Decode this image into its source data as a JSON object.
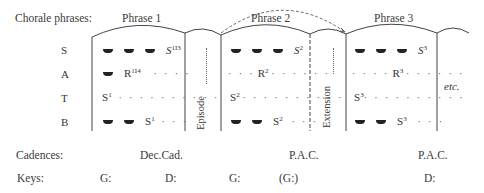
{
  "row_labels": {
    "phrases": "Chorale phrases:",
    "cadences": "Cadences:",
    "keys": "Keys:"
  },
  "phrases": [
    {
      "label": "Phrase 1"
    },
    {
      "label": "Phrase 2"
    },
    {
      "label": "Phrase 3"
    }
  ],
  "voices": [
    "S",
    "A",
    "T",
    "B"
  ],
  "sections": {
    "episode": "Episode",
    "extension": "Extension",
    "etc": "etc."
  },
  "phrase1": {
    "S": {
      "base": "S",
      "sup": "1I3"
    },
    "A": {
      "base": "R",
      "sup": "1I4"
    },
    "T": {
      "base": "S",
      "sup": "1"
    },
    "B": {
      "base": "S",
      "sup": "1"
    }
  },
  "phrase2": {
    "S": {
      "base": "S",
      "sup": "2"
    },
    "A": {
      "base": "R",
      "sup": "2"
    },
    "T": {
      "base": "S",
      "sup": "2"
    },
    "B": {
      "base": "S",
      "sup": "2"
    }
  },
  "phrase3": {
    "S": {
      "base": "S",
      "sup": "3"
    },
    "A": {
      "base": "R",
      "sup": "3"
    },
    "T": {
      "base": "S",
      "sup": "3"
    },
    "B": {
      "base": "S",
      "sup": "3"
    }
  },
  "cadences": [
    "Dec.Cad.",
    "P.A.C.",
    "P.A.C."
  ],
  "keys": [
    "G:",
    "D:",
    "G:",
    "(G:)",
    "D:"
  ],
  "dots": {
    "short": "· · · ·",
    "medium": "· · · · · ·",
    "long": "· · · · · · · · · ·",
    "tail": "· · ·",
    "lead": "· · ·"
  }
}
